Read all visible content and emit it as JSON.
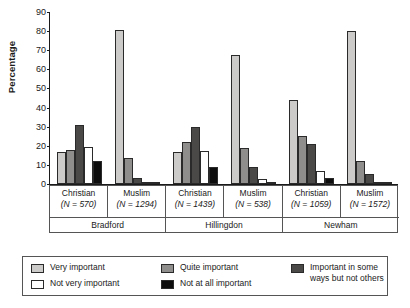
{
  "chart_data": {
    "type": "bar",
    "title": "",
    "xlabel": "",
    "ylabel": "Percentage",
    "ylim": [
      0,
      90
    ],
    "yticks": [
      0,
      10,
      20,
      30,
      40,
      50,
      60,
      70,
      80,
      90
    ],
    "grid": false,
    "legend_position": "bottom",
    "categories": [
      "Christian (N = 570)",
      "Muslim (N = 1294)",
      "Christian (N = 1439)",
      "Muslim (N = 538)",
      "Christian (N = 1059)",
      "Muslim (N = 1572)"
    ],
    "groups": [
      {
        "religion": "Christian",
        "n_label": "(N = 570)",
        "city": "Bradford"
      },
      {
        "religion": "Muslim",
        "n_label": "(N = 1294)",
        "city": "Bradford"
      },
      {
        "religion": "Christian",
        "n_label": "(N = 1439)",
        "city": "Hillingdon"
      },
      {
        "religion": "Muslim",
        "n_label": "(N = 538)",
        "city": "Hillingdon"
      },
      {
        "religion": "Christian",
        "n_label": "(N = 1059)",
        "city": "Newham"
      },
      {
        "religion": "Muslim",
        "n_label": "(N = 1572)",
        "city": "Newham"
      }
    ],
    "cities": [
      "Bradford",
      "Hillingdon",
      "Newham"
    ],
    "series": [
      {
        "name": "Very important",
        "color": "#cccbc9",
        "values": [
          17,
          80.5,
          17,
          67.5,
          44,
          80
        ]
      },
      {
        "name": "Quite important",
        "color": "#8f8e8c",
        "values": [
          18,
          13.5,
          22,
          19,
          25,
          12
        ]
      },
      {
        "name": "Important in some ways but not others",
        "color": "#4a4947",
        "values": [
          31,
          3,
          30,
          9,
          21,
          5.5
        ]
      },
      {
        "name": "Not very important",
        "color": "#ffffff",
        "values": [
          19.5,
          0.6,
          17.5,
          2.5,
          7,
          1
        ]
      },
      {
        "name": "Not at all important",
        "color": "#0d0d0d",
        "values": [
          12,
          0.4,
          9,
          1,
          3,
          0.5
        ]
      }
    ]
  },
  "legend": {
    "entries": [
      {
        "label": "Very important"
      },
      {
        "label": "Quite important"
      },
      {
        "label": "Important in some ways but not others"
      },
      {
        "label": "Not very important"
      },
      {
        "label": "Not at all important"
      }
    ]
  }
}
